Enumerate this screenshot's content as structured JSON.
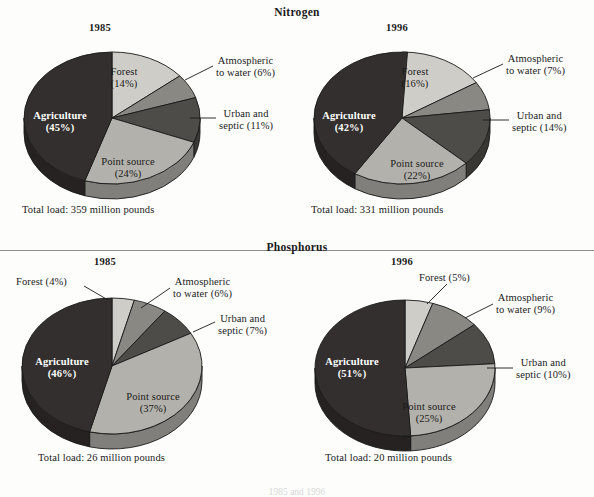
{
  "figure": {
    "sections": [
      {
        "id": "nitrogen",
        "title": "Nitrogen"
      },
      {
        "id": "phosphorus",
        "title": "Phosphorus"
      }
    ],
    "bottom_caption": "1985 and 1996"
  },
  "palette": {
    "agriculture": "#332f2e",
    "forest": "#cfcdc8",
    "atmospheric": "#8a8883",
    "urban": "#4e4c48",
    "point_source": "#b3b1ab",
    "outline": "#1a1a1a",
    "divider": "#8d8d8d"
  },
  "chart_data": [
    {
      "type": "pie",
      "id": "nitrogen-1985",
      "title": "Nitrogen",
      "year": "1985",
      "total_load": "Total load: 359 million pounds",
      "categories": [
        "Forest",
        "Atmospheric to water",
        "Urban and septic",
        "Point source",
        "Agriculture"
      ],
      "values": [
        14,
        6,
        11,
        24,
        45
      ],
      "units": "percent",
      "labels": {
        "forest": "Forest\n(14%)",
        "forest_line1": "Forest",
        "forest_line2": "(14%)",
        "atmospheric_line1": "Atmospheric",
        "atmospheric_line2": "to water (6%)",
        "urban_line1": "Urban and",
        "urban_line2": "septic (11%)",
        "point_line1": "Point source",
        "point_line2": "(24%)",
        "agriculture_line1": "Agriculture",
        "agriculture_line2": "(45%)"
      }
    },
    {
      "type": "pie",
      "id": "nitrogen-1996",
      "title": "Nitrogen",
      "year": "1996",
      "total_load": "Total load: 331 million pounds",
      "categories": [
        "Forest",
        "Atmospheric to water",
        "Urban and septic",
        "Point source",
        "Agriculture"
      ],
      "values": [
        16,
        7,
        14,
        22,
        42
      ],
      "units": "percent",
      "labels": {
        "forest_line1": "Forest",
        "forest_line2": "(16%)",
        "atmospheric_line1": "Atmospheric",
        "atmospheric_line2": "to water (7%)",
        "urban_line1": "Urban and",
        "urban_line2": "septic (14%)",
        "point_line1": "Point source",
        "point_line2": "(22%)",
        "agriculture_line1": "Agriculture",
        "agriculture_line2": "(42%)"
      }
    },
    {
      "type": "pie",
      "id": "phosphorus-1985",
      "title": "Phosphorus",
      "year": "1985",
      "total_load": "Total load: 26 million pounds",
      "categories": [
        "Forest",
        "Atmospheric to water",
        "Urban and septic",
        "Point source",
        "Agriculture"
      ],
      "values": [
        4,
        6,
        7,
        37,
        46
      ],
      "units": "percent",
      "labels": {
        "forest_line1": "Forest (4%)",
        "forest_line2": "",
        "atmospheric_line1": "Atmospheric",
        "atmospheric_line2": "to water (6%)",
        "urban_line1": "Urban and",
        "urban_line2": "septic (7%)",
        "point_line1": "Point source",
        "point_line2": "(37%)",
        "agriculture_line1": "Agriculture",
        "agriculture_line2": "(46%)"
      }
    },
    {
      "type": "pie",
      "id": "phosphorus-1996",
      "title": "Phosphorus",
      "year": "1996",
      "total_load": "Total load: 20 million pounds",
      "categories": [
        "Forest",
        "Atmospheric to water",
        "Urban and septic",
        "Point source",
        "Agriculture"
      ],
      "values": [
        5,
        9,
        10,
        25,
        51
      ],
      "units": "percent",
      "labels": {
        "forest_line1": "Forest (5%)",
        "forest_line2": "",
        "atmospheric_line1": "Atmospheric",
        "atmospheric_line2": "to water (9%)",
        "urban_line1": "Urban and",
        "urban_line2": "septic (10%)",
        "point_line1": "Point source",
        "point_line2": "(25%)",
        "agriculture_line1": "Agriculture",
        "agriculture_line2": "(51%)"
      }
    }
  ]
}
